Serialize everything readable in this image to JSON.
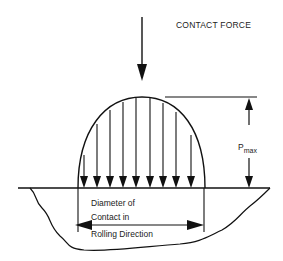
{
  "diagram": {
    "labels": {
      "contact_force": "CONTACT FORCE",
      "pmax_main": "P",
      "pmax_sub": "max",
      "dimension_line1": "Diameter of",
      "dimension_line2": "Contact in",
      "dimension_line3": "Rolling Direction"
    },
    "elements": {
      "contact_force_arrow": {
        "direction": "down",
        "x": 142,
        "y_start": 17,
        "y_end": 80
      },
      "pressure_profile": {
        "shape": "semi-ellipse",
        "left_x": 78,
        "right_x": 205,
        "peak_y": 97,
        "base_y": 188
      },
      "pressure_arrows_x": [
        84,
        97,
        110,
        123,
        136,
        150,
        163,
        176,
        191
      ],
      "pmax_dimension": {
        "x": 249,
        "top_y": 97,
        "bottom_y": 188
      },
      "contact_diameter_dimension": {
        "left_x": 78,
        "right_x": 204,
        "y": 224
      },
      "ground_surface_y": 188
    },
    "colors": {
      "line": "#111111",
      "text": "#222222",
      "background": "#ffffff"
    }
  }
}
